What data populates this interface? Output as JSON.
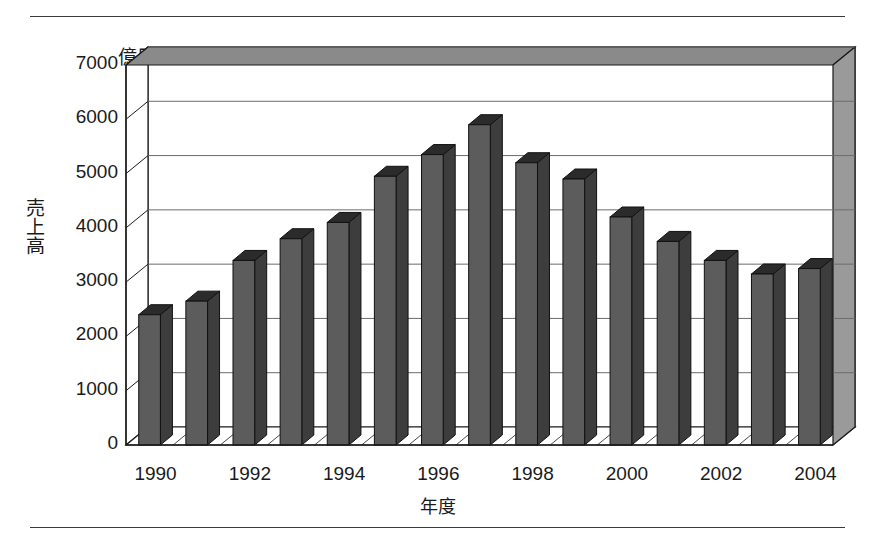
{
  "chart_data": {
    "type": "bar",
    "title": "",
    "unit_label": "億円",
    "ylabel": "売上高",
    "xlabel": "年度",
    "categories": [
      1990,
      1991,
      1992,
      1993,
      1994,
      1995,
      1996,
      1997,
      1998,
      1999,
      2000,
      2001,
      2002,
      2003,
      2004
    ],
    "values": [
      2400,
      2650,
      3400,
      3800,
      4100,
      4950,
      5350,
      5900,
      5200,
      4900,
      4200,
      3750,
      3400,
      3150,
      3250
    ],
    "xtick_labels": [
      "1990",
      "1992",
      "1994",
      "1996",
      "1998",
      "2000",
      "2002",
      "2004"
    ],
    "xtick_values": [
      1990,
      1992,
      1994,
      1996,
      1998,
      2000,
      2002,
      2004
    ],
    "ytick_labels": [
      "0",
      "1000",
      "2000",
      "3000",
      "4000",
      "5000",
      "6000",
      "7000"
    ],
    "ytick_values": [
      0,
      1000,
      2000,
      3000,
      4000,
      5000,
      6000,
      7000
    ],
    "ylim": [
      0,
      7000
    ],
    "grid": true,
    "legend": false,
    "style": "3d-column",
    "colors": {
      "bar_face": "#5c5c5c",
      "bar_top": "#2b2b2b",
      "bar_side": "#3d3d3d",
      "plot_background": "#ffffff",
      "wall_shade": "#f2f2f2",
      "gridline": "#6b6b6b",
      "axis": "#1a1a1a",
      "text": "#1a1a1a",
      "rule": "#3a3a3a"
    }
  }
}
